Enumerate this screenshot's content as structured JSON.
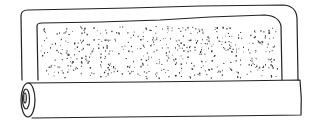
{
  "illustration": {
    "subject": "rolled mat",
    "colors": {
      "stroke": "#222222",
      "background": "#ffffff",
      "speckle": "#333333"
    },
    "speckle_count": 520
  }
}
